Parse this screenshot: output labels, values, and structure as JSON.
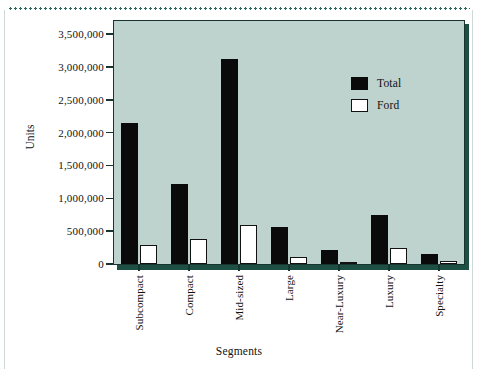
{
  "figure": {
    "background_color": "#ffffff",
    "plot_background_color": "#bed3cd",
    "axis_color": "#19332e",
    "total_color": "#0a0a0a",
    "ford_color": "#ffffff"
  },
  "chart_data": {
    "type": "bar",
    "title": "",
    "xlabel": "Segments",
    "ylabel": "Units",
    "categories": [
      "Subcompact",
      "Compact",
      "Mid-sized",
      "Large",
      "Near-Luxury",
      "Luxury",
      "Specialty"
    ],
    "series": [
      {
        "name": "Total",
        "values": [
          2140000,
          1220000,
          3120000,
          570000,
          210000,
          745000,
          150000
        ]
      },
      {
        "name": "Ford",
        "values": [
          285000,
          375000,
          595000,
          105000,
          35000,
          240000,
          45000
        ]
      }
    ],
    "ylim": [
      0,
      3700000
    ],
    "yticks": [
      0,
      500000,
      1000000,
      1500000,
      2000000,
      2500000,
      3000000,
      3500000
    ],
    "ytick_labels": [
      "0",
      "500,000",
      "1,000,000",
      "1,500,000",
      "2,000,000",
      "2,500,000",
      "3,000,000",
      "3,500,000"
    ],
    "grid": false,
    "legend": {
      "position": "upper-right-inside",
      "entries": [
        {
          "label": "Total",
          "swatch": "filled-black"
        },
        {
          "label": "Ford",
          "swatch": "outlined-white"
        }
      ]
    }
  }
}
